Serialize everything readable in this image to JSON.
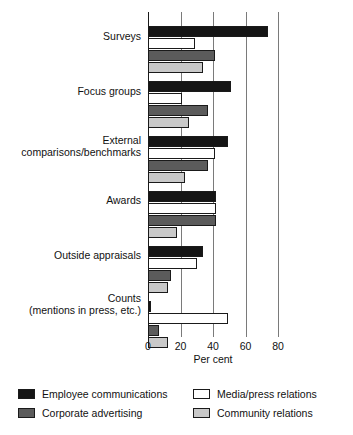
{
  "chart_data": {
    "type": "bar",
    "orientation": "horizontal",
    "title": "",
    "xlabel": "Per cent",
    "ylabel": "",
    "xlim": [
      0,
      80
    ],
    "xticks": [
      0,
      20,
      40,
      60,
      80
    ],
    "xtick_labels": [
      "0",
      "20",
      "40",
      "60",
      "80"
    ],
    "grid": true,
    "grid_axis": "x",
    "legend_position": "below",
    "categories": [
      "Surveys",
      "Focus groups",
      "External comparisons/benchmarks",
      "Awards",
      "Outside appraisals",
      "Counts (mentions in press, etc.)"
    ],
    "series": [
      {
        "name": "Employee communications",
        "color": "#151515",
        "values": [
          74,
          51,
          49,
          42,
          34,
          2
        ]
      },
      {
        "name": "Media/press relations",
        "color": "#ffffff",
        "values": [
          29,
          21,
          41,
          42,
          30,
          49
        ]
      },
      {
        "name": "Corporate advertising",
        "color": "#5b5b5b",
        "values": [
          41,
          37,
          37,
          42,
          14,
          7
        ]
      },
      {
        "name": "Community relations",
        "color": "#c9c9c9",
        "values": [
          34,
          25,
          23,
          18,
          12,
          12
        ]
      }
    ]
  },
  "axis": {
    "xlabel": "Per cent",
    "ticks": [
      {
        "label": "0",
        "value": 0
      },
      {
        "label": "20",
        "value": 20
      },
      {
        "label": "40",
        "value": 40
      },
      {
        "label": "60",
        "value": 60
      },
      {
        "label": "80",
        "value": 80
      }
    ]
  },
  "category_labels": [
    {
      "line1": "Surveys",
      "line2": ""
    },
    {
      "line1": "Focus groups",
      "line2": ""
    },
    {
      "line1": "External",
      "line2": "comparisons/benchmarks"
    },
    {
      "line1": "Awards",
      "line2": ""
    },
    {
      "line1": "Outside appraisals",
      "line2": ""
    },
    {
      "line1": "Counts",
      "line2": "(mentions in press, etc.)"
    }
  ],
  "legend": {
    "entries": [
      {
        "label": "Employee communications",
        "color": "#151515",
        "swatch": "swatch-black"
      },
      {
        "label": "Corporate advertising",
        "color": "#5b5b5b",
        "swatch": "swatch-dark-gray"
      },
      {
        "label": "Media/press relations",
        "color": "#ffffff",
        "swatch": "swatch-white"
      },
      {
        "label": "Community relations",
        "color": "#c9c9c9",
        "swatch": "swatch-light-gray"
      }
    ]
  },
  "caption": {
    "text": ""
  }
}
